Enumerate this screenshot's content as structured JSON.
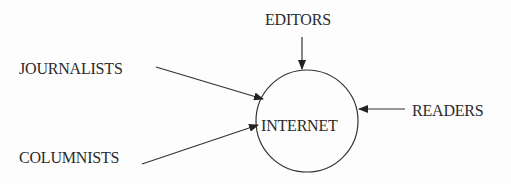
{
  "diagram": {
    "type": "flow-into-hub",
    "colors": {
      "stroke": "#333333",
      "text": "#2a2a2a",
      "background": "#fdfdfd"
    },
    "hub": {
      "label": "INTERNET",
      "shape": "circle"
    },
    "sources": [
      {
        "id": "journalists",
        "label": "JOURNALISTS",
        "direction": "from-left-top"
      },
      {
        "id": "columnists",
        "label": "COLUMNISTS",
        "direction": "from-left-bottom"
      },
      {
        "id": "editors",
        "label": "EDITORS",
        "direction": "from-top"
      },
      {
        "id": "readers",
        "label": "READERS",
        "direction": "from-right"
      }
    ]
  }
}
